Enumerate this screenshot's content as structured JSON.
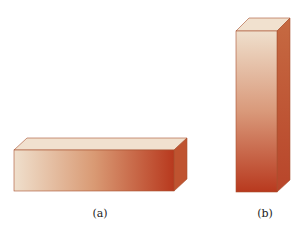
{
  "figure": {
    "panels": [
      {
        "id": "a",
        "label": "(a)",
        "orientation": "horizontal"
      },
      {
        "id": "b",
        "label": "(b)",
        "orientation": "vertical"
      }
    ],
    "colors": {
      "light": "#efdfcc",
      "dark": "#b8391e",
      "top": "#f1e1cf",
      "side": "#c0562f",
      "edge": "#a8502f"
    }
  }
}
